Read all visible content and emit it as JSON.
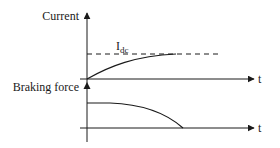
{
  "diagram": {
    "type": "timing-diagram",
    "top_plot": {
      "y_label": "Current",
      "x_label": "t",
      "reference_label_main": "I",
      "reference_label_sub": "dc",
      "reference_line_style": "dashed",
      "curve": "rises from zero and saturates at I_dc"
    },
    "bottom_plot": {
      "y_label": "Braking force",
      "x_label": "t",
      "curve": "starts at a constant level and decreases to zero"
    },
    "colors": {
      "line": "#1a1a1a",
      "background": "#ffffff"
    }
  }
}
